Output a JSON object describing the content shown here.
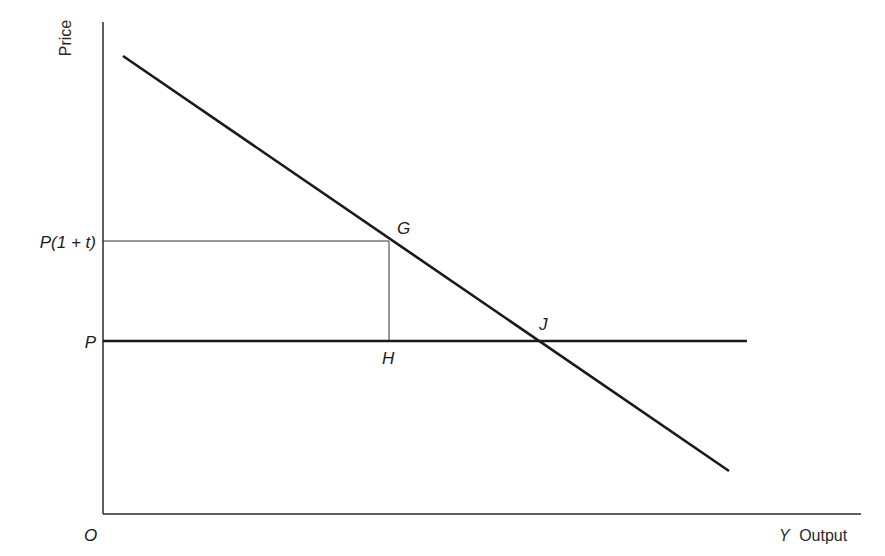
{
  "diagram": {
    "axes": {
      "y_label": "Price",
      "x_label_var": "Y",
      "x_label_text": "Output",
      "origin_label": "O"
    },
    "price_levels": {
      "taxed_price_label": "P(1 + t)",
      "price_label": "P"
    },
    "points": {
      "g": "G",
      "h": "H",
      "j": "J"
    },
    "colors": {
      "ink": "#1a1a1a",
      "background": "#ffffff"
    },
    "geometry": {
      "origin": [
        103,
        514
      ],
      "y_axis_top": [
        103,
        22
      ],
      "x_axis_end": [
        861,
        514
      ],
      "demand_line": {
        "start": [
          123,
          56
        ],
        "end": [
          729,
          471
        ]
      },
      "price_line_p": {
        "y": 341,
        "x_start": 103,
        "x_end": 747
      },
      "price_line_p1t": {
        "y": 241,
        "x_start": 103,
        "x_end": 389
      },
      "g_to_h_vertical": {
        "x": 389,
        "y_top": 241,
        "y_bottom": 341
      },
      "point_g": [
        389,
        241
      ],
      "point_h": [
        389,
        341
      ],
      "point_j": [
        537,
        341
      ]
    }
  }
}
